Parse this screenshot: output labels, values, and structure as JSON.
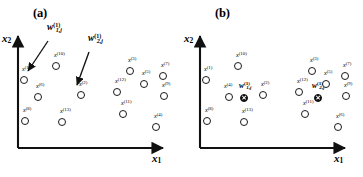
{
  "figure": {
    "background": "#ffffff",
    "ink": "#1a1a1a",
    "panels": [
      {
        "id": "a",
        "label": "(a)",
        "axes": {
          "x": "x",
          "x_sub": "1",
          "y": "x",
          "y_sub": "2"
        },
        "points": [
          {
            "name": "x",
            "sup": "(1)",
            "x": 20,
            "y": 76,
            "lx": 22,
            "ly": 66,
            "filled": false
          },
          {
            "name": "x",
            "sup": "(10)",
            "x": 52,
            "y": 62,
            "lx": 54,
            "ly": 52,
            "filled": false
          },
          {
            "name": "x",
            "sup": "(6)",
            "x": 34,
            "y": 93,
            "lx": 36,
            "ly": 83,
            "filled": false
          },
          {
            "name": "x",
            "sup": "(2)",
            "x": 77,
            "y": 91,
            "lx": 79,
            "ly": 81,
            "filled": false
          },
          {
            "name": "x",
            "sup": "(8)",
            "x": 21,
            "y": 117,
            "lx": 23,
            "ly": 107,
            "filled": false
          },
          {
            "name": "x",
            "sup": "(13)",
            "x": 58,
            "y": 118,
            "lx": 60,
            "ly": 108,
            "filled": false
          },
          {
            "name": "x",
            "sup": "(12)",
            "x": 113,
            "y": 88,
            "lx": 115,
            "ly": 78,
            "filled": false
          },
          {
            "name": "x",
            "sup": "(3)",
            "x": 126,
            "y": 67,
            "lx": 128,
            "ly": 57,
            "filled": false
          },
          {
            "name": "x",
            "sup": "(5)",
            "x": 140,
            "y": 80,
            "lx": 142,
            "ly": 70,
            "filled": false
          },
          {
            "name": "x",
            "sup": "(7)",
            "x": 159,
            "y": 72,
            "lx": 161,
            "ly": 62,
            "filled": false
          },
          {
            "name": "x",
            "sup": "(9)",
            "x": 160,
            "y": 92,
            "lx": 162,
            "ly": 82,
            "filled": false
          },
          {
            "name": "x",
            "sup": "(11)",
            "x": 119,
            "y": 110,
            "lx": 121,
            "ly": 100,
            "filled": false
          },
          {
            "name": "x",
            "sup": "(4)",
            "x": 152,
            "y": 123,
            "lx": 154,
            "ly": 113,
            "filled": false
          }
        ],
        "weights": [
          {
            "text": "w",
            "sup": "(1)",
            "sub": "1,j",
            "lx": 47,
            "ly": 22,
            "arrow": {
              "x1": 48,
              "y1": 41,
              "x2": 28,
              "y2": 71
            }
          },
          {
            "text": "w",
            "sup": "(1)",
            "sub": "2,j",
            "lx": 88,
            "ly": 33,
            "arrow": {
              "x1": 89,
              "y1": 52,
              "x2": 77,
              "y2": 85
            }
          }
        ]
      },
      {
        "id": "b",
        "label": "(b)",
        "axes": {
          "x": "x",
          "x_sub": "1",
          "y": "x",
          "y_sub": "2"
        },
        "points": [
          {
            "name": "x",
            "sup": "(1)",
            "x": 20,
            "y": 76,
            "lx": 22,
            "ly": 66,
            "filled": false
          },
          {
            "name": "x",
            "sup": "(10)",
            "x": 52,
            "y": 62,
            "lx": 54,
            "ly": 52,
            "filled": false
          },
          {
            "name": "x",
            "sup": "(4)",
            "x": 43,
            "y": 93,
            "lx": 42,
            "ly": 83,
            "filled": false
          },
          {
            "name": "x",
            "sup": "(2)",
            "x": 77,
            "y": 91,
            "lx": 79,
            "ly": 81,
            "filled": false
          },
          {
            "name": "x",
            "sup": "(8)",
            "x": 21,
            "y": 117,
            "lx": 23,
            "ly": 107,
            "filled": false
          },
          {
            "name": "x",
            "sup": "(13)",
            "x": 58,
            "y": 118,
            "lx": 60,
            "ly": 108,
            "filled": false
          },
          {
            "name": "x",
            "sup": "(12)",
            "x": 113,
            "y": 88,
            "lx": 115,
            "ly": 78,
            "filled": false
          },
          {
            "name": "x",
            "sup": "(3)",
            "x": 126,
            "y": 67,
            "lx": 128,
            "ly": 57,
            "filled": false
          },
          {
            "name": "x",
            "sup": "(5)",
            "x": 140,
            "y": 80,
            "lx": 142,
            "ly": 70,
            "filled": false
          },
          {
            "name": "x",
            "sup": "(7)",
            "x": 159,
            "y": 72,
            "lx": 161,
            "ly": 62,
            "filled": false
          },
          {
            "name": "x",
            "sup": "(9)",
            "x": 160,
            "y": 92,
            "lx": 162,
            "ly": 82,
            "filled": false
          },
          {
            "name": "x",
            "sup": "(11)",
            "x": 119,
            "y": 110,
            "lx": 121,
            "ly": 100,
            "filled": false
          },
          {
            "name": "x",
            "sup": "(6)",
            "x": 152,
            "y": 123,
            "lx": 154,
            "ly": 113,
            "filled": false
          },
          {
            "name": "centroid",
            "sup": "",
            "x": 58,
            "y": 94,
            "lx": 0,
            "ly": 0,
            "filled": true
          },
          {
            "name": "centroid",
            "sup": "",
            "x": 132,
            "y": 94,
            "lx": 0,
            "ly": 0,
            "filled": true
          }
        ],
        "weights": [
          {
            "text": "w",
            "sup": "(1)",
            "sub": "1,j",
            "lx": 57,
            "ly": 81,
            "arrow": null
          },
          {
            "text": "w",
            "sup": "(1)",
            "sub": "2,j",
            "lx": 130,
            "ly": 81,
            "arrow": null
          }
        ]
      }
    ]
  }
}
